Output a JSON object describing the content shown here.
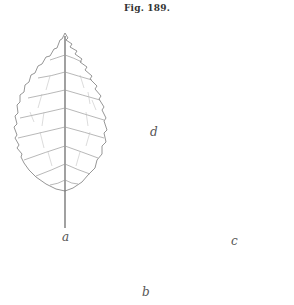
{
  "figure": {
    "caption": "Fig. 189.",
    "leaves": [
      {
        "id": "a",
        "label": "a"
      },
      {
        "id": "b",
        "label": "b"
      },
      {
        "id": "c",
        "label": "c"
      },
      {
        "id": "d",
        "label": "d"
      }
    ],
    "colors": {
      "line": "#8a8a8a",
      "midrib": "#6e6e6e",
      "label": "#555555",
      "background": "#ffffff"
    }
  }
}
